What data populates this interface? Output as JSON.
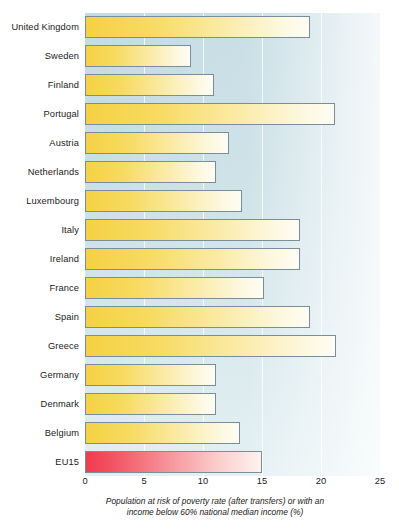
{
  "chart_data": {
    "type": "bar",
    "orientation": "horizontal",
    "title": "",
    "subtitle": "",
    "xlabel": "Population at risk of poverty rate (after transfers) or with an income below 60% national median income (%)",
    "ylabel": "",
    "xlim": [
      0,
      25
    ],
    "ylim": null,
    "grid": true,
    "legend": null,
    "xticks": [
      "0",
      "5",
      "10",
      "15",
      "20",
      "25"
    ],
    "xtick_values": [
      0,
      5,
      10,
      15,
      20,
      25
    ],
    "categories": [
      "United Kingdom",
      "Sweden",
      "Finland",
      "Portugal",
      "Austria",
      "Netherlands",
      "Luxembourg",
      "Italy",
      "Ireland",
      "France",
      "Spain",
      "Greece",
      "Germany",
      "Denmark",
      "Belgium",
      "EU15"
    ],
    "values": [
      19.1,
      9.0,
      10.9,
      21.2,
      12.2,
      11.1,
      13.3,
      18.2,
      18.2,
      15.2,
      19.1,
      21.3,
      11.1,
      11.1,
      13.1,
      15.0
    ],
    "highlight_index": 15,
    "colors": {
      "bar_start": "#f5d143",
      "bar_end": "#fefdf4",
      "bar_border": "#7a8e99",
      "accent_start": "#ef3b4e",
      "accent_end": "#fdf2ef",
      "plot_background": "#c3dbe3",
      "gridline": "#ffffff",
      "text": "#1b1b1b"
    }
  },
  "axis": {
    "caption_line1": "Population at risk of poverty rate (after transfers) or with an",
    "caption_line2": "income below 60% national median income (%)"
  }
}
